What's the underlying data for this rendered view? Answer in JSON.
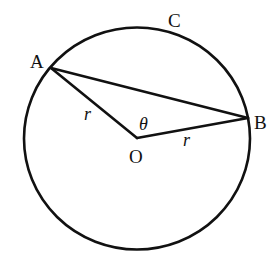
{
  "diagram": {
    "type": "circle-geometry",
    "stroke_color": "#111111",
    "background": "#ffffff",
    "circle": {
      "name": "C",
      "center": [
        137,
        138
      ],
      "rx": 113,
      "ry": 111
    },
    "points": {
      "A": {
        "label": "A",
        "pos": [
          51,
          68
        ]
      },
      "B": {
        "label": "B",
        "pos": [
          248,
          118
        ]
      },
      "O": {
        "label": "O",
        "pos": [
          137,
          138
        ]
      }
    },
    "segments": [
      {
        "from": "A",
        "to": "B",
        "name": "chord-ab"
      },
      {
        "from": "A",
        "to": "O",
        "name": "radius-oa"
      },
      {
        "from": "O",
        "to": "B",
        "name": "radius-ob"
      }
    ],
    "labels": {
      "A": "A",
      "B": "B",
      "C": "C",
      "O": "O",
      "theta": "θ",
      "r_oa": "r",
      "r_ob": "r"
    }
  }
}
